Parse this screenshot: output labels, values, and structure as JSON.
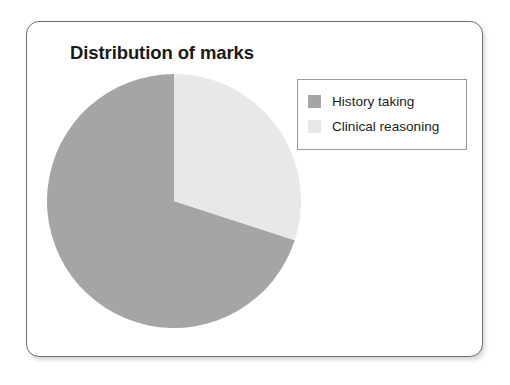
{
  "card": {
    "border_color": "#6e6e6e",
    "background": "#ffffff"
  },
  "title": "Distribution of marks",
  "legend": {
    "position": "top-right",
    "border_color": "#9a9a9a",
    "items": [
      {
        "label": "History taking",
        "color": "#a5a5a5"
      },
      {
        "label": "Clinical reasoning",
        "color": "#e8e8e8"
      }
    ]
  },
  "chart_data": {
    "type": "pie",
    "title": "Distribution of marks",
    "categories": [
      "History taking",
      "Clinical reasoning"
    ],
    "values": [
      70,
      30
    ],
    "value_unit": "percent",
    "colors": [
      "#a5a5a5",
      "#e8e8e8"
    ],
    "start_angle_deg": 0,
    "direction": "counterclockwise",
    "labels_shown": false,
    "legend": true,
    "legend_position": "top-right",
    "grid": false,
    "xlabel": "",
    "ylabel": ""
  }
}
